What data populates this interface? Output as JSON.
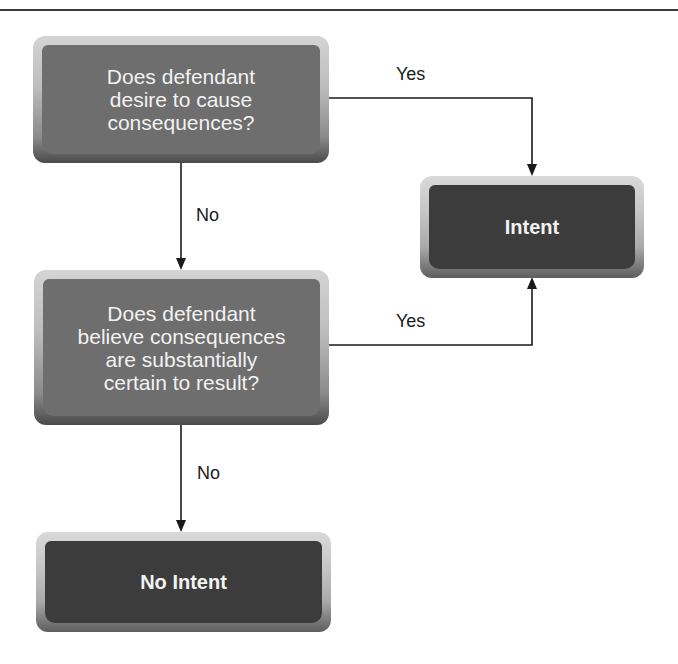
{
  "diagram": {
    "type": "flowchart",
    "nodes": {
      "question1": {
        "kind": "decision",
        "text": "Does defendant\ndesire to cause\nconsequences?"
      },
      "question2": {
        "kind": "decision",
        "text": "Does defendant\nbelieve consequences\nare substantially\ncertain to result?"
      },
      "intent": {
        "kind": "outcome",
        "text": "Intent"
      },
      "no_intent": {
        "kind": "outcome",
        "text": "No Intent"
      }
    },
    "edges": [
      {
        "from": "question1",
        "to": "intent",
        "label": "Yes"
      },
      {
        "from": "question1",
        "to": "question2",
        "label": "No"
      },
      {
        "from": "question2",
        "to": "intent",
        "label": "Yes"
      },
      {
        "from": "question2",
        "to": "no_intent",
        "label": "No"
      }
    ],
    "colors": {
      "question_fill": "#6e6e6e",
      "outcome_fill": "#3c3c3c",
      "text": "#f2f2f2",
      "line": "#1a1a1a"
    }
  }
}
